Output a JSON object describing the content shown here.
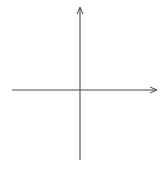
{
  "diagram": {
    "type": "coordinate-plane",
    "x_axis": {
      "label": "x",
      "range": [
        -6,
        6
      ],
      "tick_labels": [
        "−5",
        "−4",
        "−3",
        "−2",
        "−1",
        "1",
        "2",
        "3",
        "4",
        "5"
      ],
      "tick_values": [
        -5,
        -4,
        -3,
        -2,
        -1,
        1,
        2,
        3,
        4,
        5
      ]
    },
    "y_axis": {
      "label": "y",
      "range": [
        -6,
        6
      ],
      "tick_labels": [
        "5",
        "4",
        "3",
        "2",
        "1",
        "−1",
        "−2",
        "−3",
        "−4",
        "−5"
      ],
      "tick_values": [
        5,
        4,
        3,
        2,
        1,
        -1,
        -2,
        -3,
        -4,
        -5
      ]
    },
    "grid": true,
    "colors": {
      "grid": "#c9c9c9",
      "axis": "#4a4a4a",
      "text": "#3a3a3a"
    }
  }
}
